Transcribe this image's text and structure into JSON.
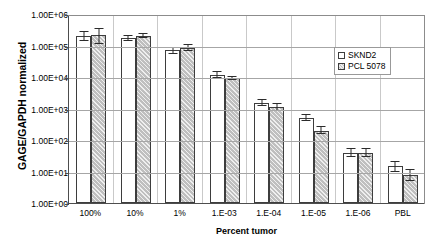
{
  "chart_data": {
    "type": "bar",
    "title": "",
    "xlabel": "Percent tumor",
    "ylabel": "GAGE/GAPDH normalized",
    "yscale": "log",
    "ylim": [
      1,
      1000000
    ],
    "ytick_labels": [
      "1.00E+06",
      "1.00E+05",
      "1.00E+04",
      "1.00E+03",
      "1.00E+02",
      "1.00E+01",
      "1.00E+00"
    ],
    "ytick_values": [
      1000000,
      100000,
      10000,
      1000,
      100,
      10,
      1
    ],
    "grid": true,
    "legend_position": "right-inside",
    "categories": [
      "100%",
      "10%",
      "1%",
      "1.E-03",
      "1.E-04",
      "1.E-05",
      "1.E-06",
      "PBL"
    ],
    "series": [
      {
        "name": "SKND2",
        "color": "#ffffff",
        "values": [
          200000,
          170000,
          70000,
          12000,
          1500,
          500,
          40,
          15
        ],
        "errors_high": [
          60000,
          30000,
          15000,
          2500,
          300,
          110,
          11,
          5
        ],
        "errors_low": [
          60000,
          30000,
          15000,
          2500,
          300,
          110,
          11,
          5
        ]
      },
      {
        "name": "PCL 5078",
        "color": "#bfbfbf",
        "values": [
          220000,
          200000,
          85000,
          9000,
          1100,
          200,
          40,
          8
        ],
        "errors_high": [
          110000,
          30000,
          17000,
          1000,
          250,
          50,
          11,
          3
        ],
        "errors_low": [
          110000,
          30000,
          17000,
          1000,
          250,
          50,
          11,
          3
        ]
      }
    ]
  },
  "legend": {
    "items": [
      {
        "label": "SKND2"
      },
      {
        "label": "PCL 5078"
      }
    ]
  },
  "axes": {
    "y_title": "GAGE/GAPDH normalized",
    "x_title": "Percent tumor"
  }
}
